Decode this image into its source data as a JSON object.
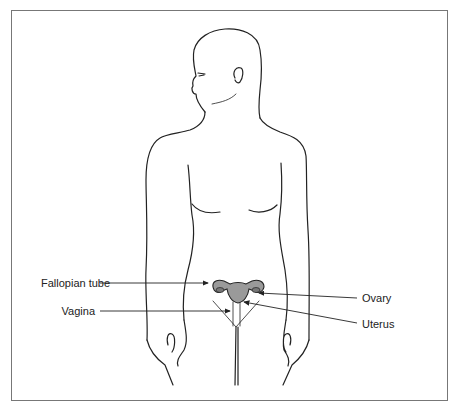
{
  "figure": {
    "labels": {
      "fallopian_tube": "Fallopian tube",
      "vagina": "Vagina",
      "ovary": "Ovary",
      "uterus": "Uterus"
    },
    "colors": {
      "outline": "#222222",
      "organ_fill": "#9a9a9a",
      "frame": "#777777"
    }
  }
}
